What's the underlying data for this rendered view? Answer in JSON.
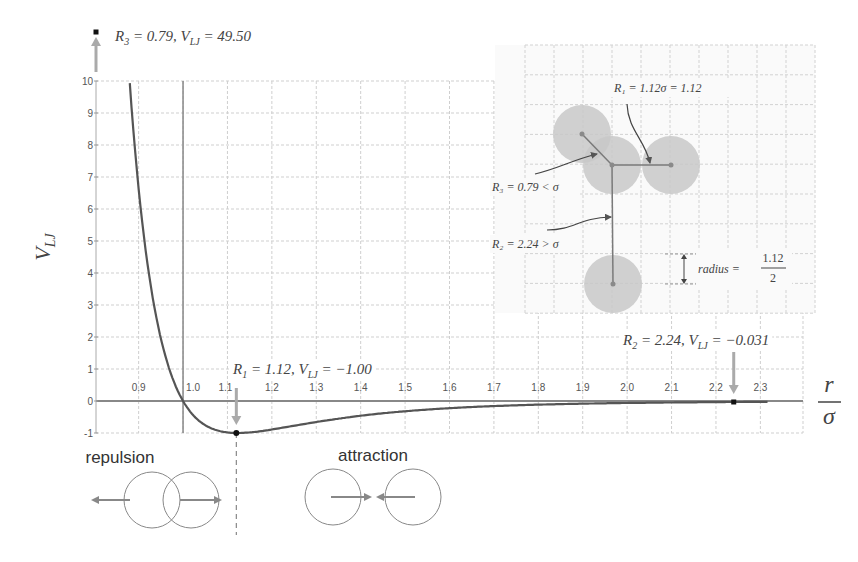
{
  "chart_data": {
    "type": "line",
    "title": "",
    "xlabel": "r/σ",
    "ylabel": "V_LJ",
    "xlim": [
      0.804,
      2.396
    ],
    "ylim": [
      -1,
      10
    ],
    "grid": true,
    "function": "V_LJ = 4*((1/r)^12 - (1/r)^6)",
    "series": [
      {
        "name": "Lennard-Jones potential",
        "x": [
          0.88,
          0.9,
          0.92,
          0.95,
          1.0,
          1.05,
          1.12,
          1.2,
          1.3,
          1.4,
          1.5,
          1.6,
          1.7,
          1.8,
          1.9,
          2.0,
          2.1,
          2.2,
          2.3
        ],
        "y": [
          10.3,
          7.2,
          4.9,
          2.3,
          0.0,
          -0.72,
          -1.0,
          -0.81,
          -0.52,
          -0.33,
          -0.21,
          -0.14,
          -0.096,
          -0.066,
          -0.046,
          -0.031,
          -0.023,
          -0.017,
          -0.013
        ]
      }
    ],
    "x_ticks": [
      "0.9",
      "1.0",
      "1.1",
      "1.2",
      "1.3",
      "1.4",
      "1.5",
      "1.6",
      "1.7",
      "1.8",
      "1.9",
      "2.0",
      "2.1",
      "2.2",
      "2.3"
    ],
    "x_tick_values": [
      0.9,
      1.0,
      1.1,
      1.2,
      1.3,
      1.4,
      1.5,
      1.6,
      1.7,
      1.8,
      1.9,
      2.0,
      2.1,
      2.2,
      2.3
    ],
    "y_ticks": [
      "-1",
      "0",
      "1",
      "2",
      "3",
      "4",
      "5",
      "6",
      "7",
      "8",
      "9",
      "10"
    ],
    "y_tick_values": [
      -1,
      0,
      1,
      2,
      3,
      4,
      5,
      6,
      7,
      8,
      9,
      10
    ],
    "points": [
      {
        "name": "R3",
        "r": 0.79,
        "v": 49.5,
        "label_sym": "R",
        "label_sub": "3",
        "label_text": " = 0.79, ",
        "label_v": "V",
        "label_vsub": "LJ",
        "label_val": " = 49.50"
      },
      {
        "name": "R1",
        "r": 1.12,
        "v": -1.0,
        "label_sym": "R",
        "label_sub": "1",
        "label_text": " = 1.12, ",
        "label_v": "V",
        "label_vsub": "LJ",
        "label_val": " = −1.00"
      },
      {
        "name": "R2",
        "r": 2.24,
        "v": -0.031,
        "label_sym": "R",
        "label_sub": "2",
        "label_text": " = 2.24, ",
        "label_v": "V",
        "label_vsub": "LJ",
        "label_val": " = −0.031"
      }
    ],
    "annotations": {
      "repulsion": "repulsion",
      "attraction": "attraction"
    },
    "inset": {
      "r1_label": "R₁ = 1.12σ = 1.12",
      "r3_label": "R₃ = 0.79 < σ",
      "r2_label": "R₂ = 2.24 > σ",
      "radius_label": "radius =",
      "radius_num": "1.12",
      "radius_den": "2"
    }
  },
  "axis_labels": {
    "y_main": "V",
    "y_sub": "LJ",
    "x_num": "r",
    "x_den": "σ"
  }
}
